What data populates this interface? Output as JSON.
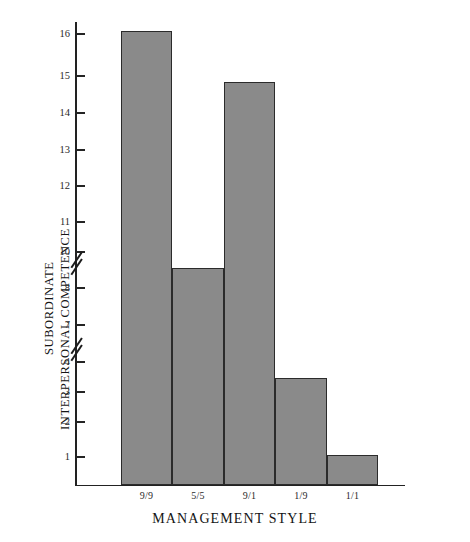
{
  "chart_data": {
    "type": "bar",
    "title": "",
    "xlabel": "MANAGEMENT STYLE",
    "ylabel": "SUBORDINATE INTERPERSONAL COMPETENCE",
    "ylabel_lines": [
      "SUBORDINATE",
      "INTERPERSONAL COMPETENCE"
    ],
    "categories": [
      "9/9",
      "5/5",
      "9/1",
      "1/9",
      "1/1"
    ],
    "values": [
      16.1,
      8.6,
      14.65,
      3.4,
      1.05
    ],
    "series": [
      {
        "name": "Subordinate Interpersonal Competence",
        "values": [
          16.1,
          8.6,
          14.65,
          3.4,
          1.05
        ]
      }
    ],
    "ytick_labels": [
      "16",
      "15",
      "14",
      "13",
      "12",
      "11",
      "10",
      "8",
      "7",
      "4",
      "3",
      "2",
      "1"
    ],
    "ytick_values": [
      16,
      15,
      14,
      13,
      12,
      11,
      10,
      8,
      7,
      4,
      3,
      2,
      1
    ],
    "ylim": [
      0,
      16.5
    ],
    "axis_broken": true,
    "axis_breaks": [
      {
        "between": "10 and 8"
      },
      {
        "between": "7 and 4"
      }
    ],
    "grid": false,
    "legend": "none",
    "bar_fill_color": "#8a8a8a",
    "bar_border_color": "#2b2b2b",
    "axis_color": "#222222"
  },
  "axis": {
    "y_ticks": [
      {
        "label": "16",
        "y": 34
      },
      {
        "label": "15",
        "y": 76
      },
      {
        "label": "14",
        "y": 113
      },
      {
        "label": "13",
        "y": 150
      },
      {
        "label": "12",
        "y": 186
      },
      {
        "label": "11",
        "y": 222
      },
      {
        "label": "10",
        "y": 252
      },
      {
        "label": "8",
        "y": 288
      },
      {
        "label": "7",
        "y": 325
      },
      {
        "label": "4",
        "y": 362
      },
      {
        "label": "3",
        "y": 392
      },
      {
        "label": "2",
        "y": 422
      },
      {
        "label": "1",
        "y": 457
      }
    ],
    "breaks": [
      {
        "y": 253
      },
      {
        "y": 339
      }
    ]
  },
  "bars": [
    {
      "category": "9/9",
      "value": 16.1,
      "x": 121,
      "width": 51,
      "top": 31,
      "bottom": 485
    },
    {
      "category": "5/5",
      "value": 8.6,
      "x": 172,
      "width": 52,
      "top": 268,
      "bottom": 485
    },
    {
      "category": "9/1",
      "value": 14.65,
      "x": 224,
      "width": 51,
      "top": 82,
      "bottom": 485
    },
    {
      "category": "1/9",
      "value": 3.4,
      "x": 275,
      "width": 52,
      "top": 378,
      "bottom": 485
    },
    {
      "category": "1/1",
      "value": 1.05,
      "x": 327,
      "width": 51,
      "top": 455,
      "bottom": 485
    }
  ]
}
